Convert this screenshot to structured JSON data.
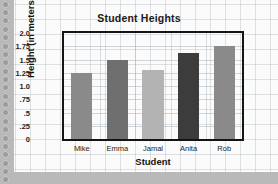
{
  "chart_data": {
    "type": "bar",
    "title": "Student Heights",
    "xlabel": "Student",
    "ylabel": "Height (in meters)",
    "categories": [
      "Mike",
      "Emma",
      "Jamal",
      "Anita",
      "Rob"
    ],
    "values": [
      1.25,
      1.5,
      1.3,
      1.63,
      1.75
    ],
    "bar_colors": [
      "#8a8a8a",
      "#6f6f6f",
      "#b3b3b3",
      "#3c3c3c",
      "#8a8a8a"
    ],
    "ylim": [
      0,
      2.0
    ],
    "ytick_labels": [
      "0",
      ".25",
      ".5",
      ".75",
      "1.0",
      "1.25",
      "1.5",
      "1.75",
      "2.0"
    ],
    "ytick_values": [
      0,
      0.25,
      0.5,
      0.75,
      1.0,
      1.25,
      1.5,
      1.75,
      2.0
    ],
    "grid": true,
    "legend": "none"
  },
  "paper": {
    "background_color": "#fbfbfb",
    "grid_color": "#96a5af",
    "outside_color": "#b9b9b9",
    "binding_hole_count": 22
  }
}
